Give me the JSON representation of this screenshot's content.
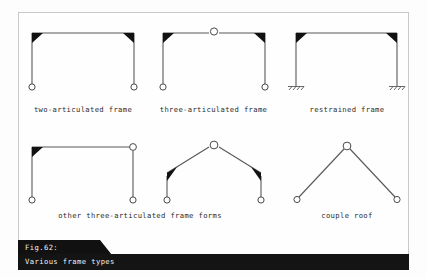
{
  "figure": {
    "caption_number": "Fig.62:",
    "caption_title": "Various frame types",
    "background_color": "#fdfdfd",
    "border_color": "#c9c9c9",
    "line_color": "#4a4a4a",
    "banner_color": "#111111",
    "banner_text_color": "#f2f2f2"
  },
  "diagrams": [
    {
      "id": "two-articulated-frame",
      "label": "two-articulated frame",
      "label_x": 83,
      "label_y": 110,
      "type": "portal",
      "supports": [
        "pin",
        "pin"
      ],
      "corners": [
        "rigid",
        "rigid"
      ],
      "apex_hinge": false
    },
    {
      "id": "three-articulated-frame",
      "label": "three-articulated frame",
      "label_x": 213,
      "label_y": 110,
      "type": "portal",
      "supports": [
        "pin",
        "pin"
      ],
      "corners": [
        "rigid",
        "rigid"
      ],
      "apex_hinge": true
    },
    {
      "id": "restrained-frame",
      "label": "restrained frame",
      "label_x": 347,
      "label_y": 110,
      "type": "portal",
      "supports": [
        "fixed",
        "fixed"
      ],
      "corners": [
        "rigid",
        "rigid"
      ],
      "apex_hinge": false
    },
    {
      "id": "other-three-articulated-frame-forms",
      "label": "other three-articulated frame forms",
      "label_x": 140,
      "label_y": 216,
      "type": "portal-asymmetric",
      "supports": [
        "pin",
        "pin"
      ],
      "corners": [
        "rigid",
        "hinge"
      ],
      "apex_hinge": false
    },
    {
      "id": "gable-frame",
      "label": "",
      "type": "gable",
      "supports": [
        "pin",
        "pin"
      ],
      "corners": [
        "rigid",
        "rigid"
      ],
      "apex_hinge": true
    },
    {
      "id": "couple-roof",
      "label": "couple roof",
      "label_x": 347,
      "label_y": 216,
      "type": "a-frame",
      "supports": [
        "pin",
        "pin"
      ],
      "apex_hinge": true
    }
  ]
}
